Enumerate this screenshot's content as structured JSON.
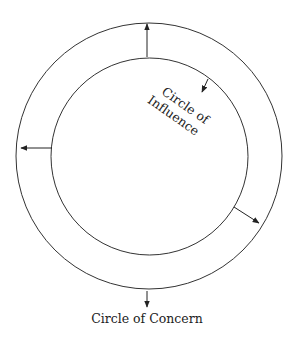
{
  "diagram": {
    "type": "concentric-circles",
    "colors": {
      "line": "#222222",
      "background": "#ffffff"
    },
    "outer_circle": {
      "label": "Circle of Concern",
      "cx": 149,
      "cy": 156,
      "r": 133
    },
    "inner_circle": {
      "label_line1": "Circle of",
      "label_line2": "Influence",
      "cx": 149,
      "cy": 157,
      "r": 99
    },
    "arrows": [
      {
        "name": "up",
        "direction": "outward"
      },
      {
        "name": "left",
        "direction": "outward"
      },
      {
        "name": "lower-right",
        "direction": "outward"
      },
      {
        "name": "down",
        "direction": "outward-to-label"
      },
      {
        "name": "upper-right",
        "direction": "inward-to-label"
      }
    ]
  }
}
